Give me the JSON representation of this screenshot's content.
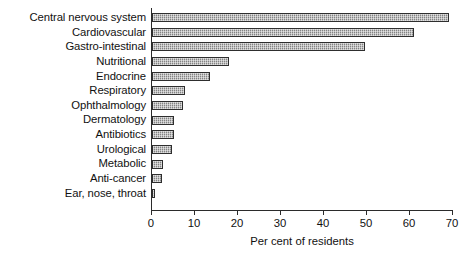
{
  "chart_data": {
    "type": "bar",
    "orientation": "horizontal",
    "title": "",
    "xlabel": "Per cent of residents",
    "ylabel": "",
    "xlim": [
      0,
      70
    ],
    "xticks": [
      0,
      10,
      20,
      30,
      40,
      50,
      60,
      70
    ],
    "grid": false,
    "legend": false,
    "categories": [
      "Central nervous system",
      "Cardiovascular",
      "Gastro-intestinal",
      "Nutritional",
      "Endocrine",
      "Respiratory",
      "Ophthalmology",
      "Dermatology",
      "Antibiotics",
      "Urological",
      "Metabolic",
      "Anti-cancer",
      "Ear, nose, throat"
    ],
    "values": [
      69,
      61,
      49.5,
      18,
      13.5,
      7.7,
      7.3,
      5.2,
      5.0,
      4.6,
      2.5,
      2.3,
      0.8
    ],
    "bar_color": "#9d9d9d",
    "bar_edge_color": "#2e2e2e",
    "axis_color": "#2b2b2b",
    "background_color": "#ffffff"
  }
}
